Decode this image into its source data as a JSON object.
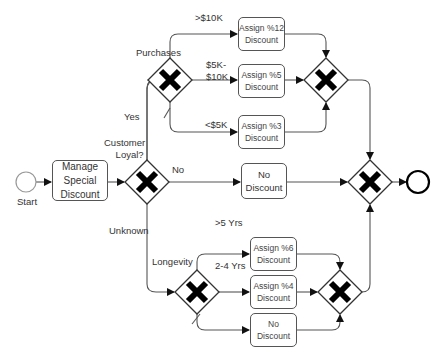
{
  "diagram": {
    "type": "bpmn-process",
    "start_label": "Start",
    "manage_task": {
      "line1": "Manage",
      "line2": "Special",
      "line3": "Discount"
    },
    "main_gateway_label": {
      "line1": "Customer",
      "line2": "Loyal?"
    },
    "branches": {
      "yes": "Yes",
      "no": "No",
      "unknown": "Unknown"
    },
    "purchases": {
      "gateway_label": "Purchases",
      "conditions": {
        "high": ">$10K",
        "mid_line1": "$5K-",
        "mid_line2": "$10K",
        "low": "<$5K"
      },
      "tasks": [
        {
          "line1": "Assign %12",
          "line2": "Discount"
        },
        {
          "line1": "Assign %5",
          "line2": "Discount"
        },
        {
          "line1": "Assign %3",
          "line2": "Discount"
        }
      ]
    },
    "no_task": {
      "line1": "No",
      "line2": "Discount"
    },
    "longevity": {
      "gateway_label": "Longevity",
      "conditions": {
        "high": ">5 Yrs",
        "mid": "2-4 Yrs"
      },
      "tasks": [
        {
          "line1": "Assign %6",
          "line2": "Discount"
        },
        {
          "line1": "Assign %4",
          "line2": "Discount"
        },
        {
          "line1": "No",
          "line2": "Discount"
        }
      ]
    },
    "colors": {
      "line": "#555555",
      "gateway_x": "#000000",
      "text": "#333333"
    }
  }
}
